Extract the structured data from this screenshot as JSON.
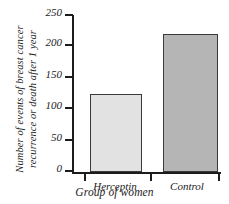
{
  "chart_data": {
    "type": "bar",
    "title": "",
    "categories": [
      "Herceptin",
      "Control"
    ],
    "values": [
      125,
      220
    ],
    "xlabel": "Group of women",
    "ylabel": "Number of events of breast cancer recurrence or death after 1 year",
    "ylabel_lines": [
      "Number of events of breast cancer",
      "recurrence or death after 1 year"
    ],
    "ylim": [
      0,
      250
    ],
    "yticks": [
      0,
      50,
      100,
      150,
      200,
      250
    ],
    "ytick_labels": [
      "0",
      "50",
      "100",
      "150",
      "200",
      "250"
    ],
    "grid": false,
    "legend": "none",
    "bar_colors": [
      "#e2e2e2",
      "#b5b5b5"
    ],
    "bar_edge_color": "#3a3a3a",
    "axis_color": "#1c1c1c",
    "background": "#ffffff",
    "series": [
      {
        "name": "Events",
        "points": [
          {
            "category": "Herceptin",
            "value": 125,
            "color": "#e2e2e2"
          },
          {
            "category": "Control",
            "value": 220,
            "color": "#b5b5b5"
          }
        ]
      }
    ]
  }
}
